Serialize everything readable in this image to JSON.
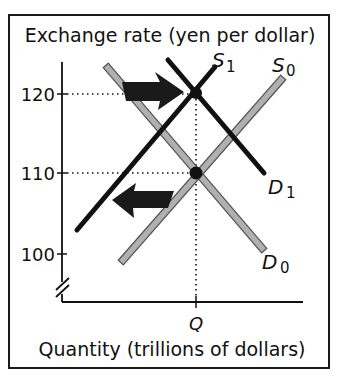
{
  "diagram": {
    "y_axis_label": "Exchange rate (yen per dollar)",
    "x_axis_label": "Quantity (trillions of dollars)",
    "y_ticks": [
      {
        "label": "120",
        "value": 120
      },
      {
        "label": "110",
        "value": 110
      },
      {
        "label": "100",
        "value": 100
      }
    ],
    "x_ticks": [
      {
        "label": "Q"
      }
    ],
    "curves": {
      "S0": {
        "main": "S",
        "sub": "0",
        "color": "#a9a9a9",
        "style": "gray-outlined"
      },
      "S1": {
        "main": "S",
        "sub": "1",
        "color": "#111111",
        "style": "solid-black"
      },
      "D0": {
        "main": "D",
        "sub": "0",
        "color": "#a9a9a9",
        "style": "gray-outlined"
      },
      "D1": {
        "main": "D",
        "sub": "1",
        "color": "#111111",
        "style": "solid-black"
      }
    },
    "equilibria": [
      {
        "name": "initial",
        "price": 110,
        "quantity": "Q",
        "curves": [
          "S0",
          "D0"
        ]
      },
      {
        "name": "new",
        "price": 120,
        "quantity": "Q",
        "curves": [
          "S1",
          "D1"
        ]
      }
    ],
    "shift_arrows": [
      {
        "name": "demand-increase",
        "direction": "right",
        "from": "D0",
        "to": "D1"
      },
      {
        "name": "supply-decrease",
        "direction": "left",
        "from": "S0",
        "to": "S1"
      }
    ],
    "axis_break": true
  }
}
